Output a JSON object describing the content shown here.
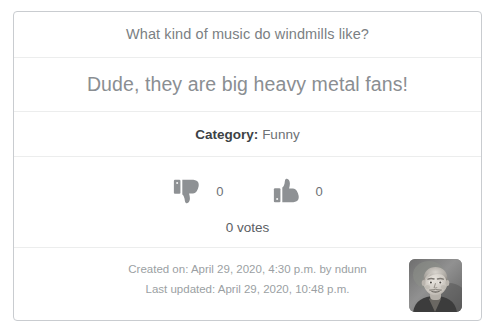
{
  "card": {
    "question": "What kind of music do windmills like?",
    "punchline": "Dude, they are big heavy metal fans!",
    "category_label": "Category:",
    "category_value": "Funny",
    "votes": {
      "downvote_icon": "thumbs-down-icon",
      "downvote_count": "0",
      "upvote_icon": "thumbs-up-icon",
      "upvote_count": "0",
      "total_votes": "0 votes"
    },
    "footer": {
      "created_on": "Created on: April 29, 2020, 4:30 p.m. by ndunn",
      "last_updated": "Last updated: April 29, 2020, 10:48 p.m.",
      "avatar_icon": "user-avatar-photo"
    }
  },
  "colors": {
    "card_border": "#c9ccd0",
    "divider": "#eceded",
    "question_text": "#7b7f83",
    "punchline_text": "#8a8e92",
    "category_label": "#3d4245",
    "category_value": "#6d7175",
    "icon_gray": "#8e9194",
    "footer_text": "#9b9fa3",
    "background": "#ffffff"
  }
}
